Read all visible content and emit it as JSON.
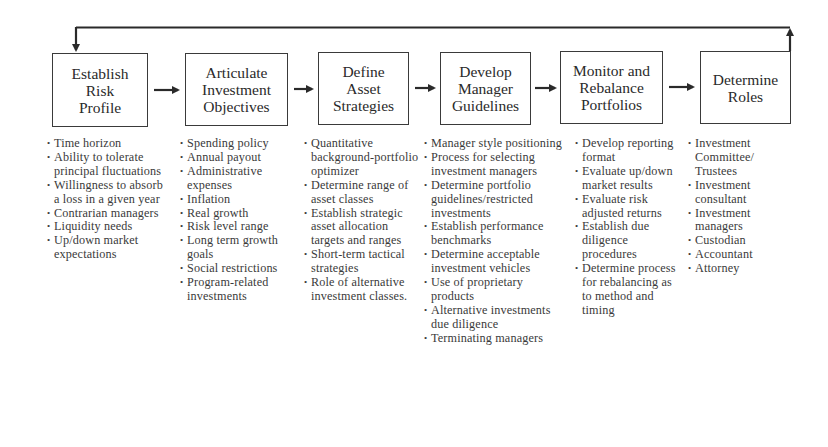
{
  "diagram": {
    "type": "process-flow",
    "feedback_loop": {
      "from": "Determine Roles",
      "to": "Establish Risk Profile"
    },
    "colors": {
      "line": "#2a2a2a",
      "text": "#2a2a2a",
      "background": "#ffffff"
    },
    "steps": [
      {
        "title": "Establish\nRisk\nProfile",
        "items": [
          "Time horizon",
          "Ability to tolerate principal fluctuations",
          "Willingness to absorb a loss in a given year",
          "Contrarian managers",
          "Liquidity needs",
          "Up/down market expectations"
        ]
      },
      {
        "title": "Articulate\nInvestment\nObjectives",
        "items": [
          "Spending policy",
          "Annual payout",
          "Administrative expenses",
          "Inflation",
          "Real growth",
          "Risk level range",
          "Long term growth goals",
          "Social restrictions",
          "Program-related investments"
        ]
      },
      {
        "title": "Define\nAsset\nStrategies",
        "items": [
          "Quantitative background-portfolio optimizer",
          "Determine range of asset classes",
          "Establish strategic asset allocation targets and ranges",
          "Short-term tactical strategies",
          "Role of alternative investment classes."
        ]
      },
      {
        "title": "Develop\nManager\nGuidelines",
        "items": [
          "Manager style positioning",
          "Process for selecting investment managers",
          "Determine portfolio guidelines/restricted investments",
          "Establish performance benchmarks",
          "Determine acceptable investment vehicles",
          "Use of proprietary products",
          "Alternative investments due diligence",
          "Terminating managers"
        ]
      },
      {
        "title": "Monitor and\nRebalance\nPortfolios",
        "items": [
          "Develop reporting format",
          "Evaluate up/down market results",
          "Evaluate risk adjusted returns",
          "Establish due diligence procedures",
          "Determine process for rebalancing as to method and timing"
        ]
      },
      {
        "title": "Determine\nRoles",
        "items": [
          "Investment Committee/ Trustees",
          "Investment consultant",
          "Investment managers",
          "Custodian",
          "Accountant",
          "Attorney"
        ]
      }
    ]
  }
}
